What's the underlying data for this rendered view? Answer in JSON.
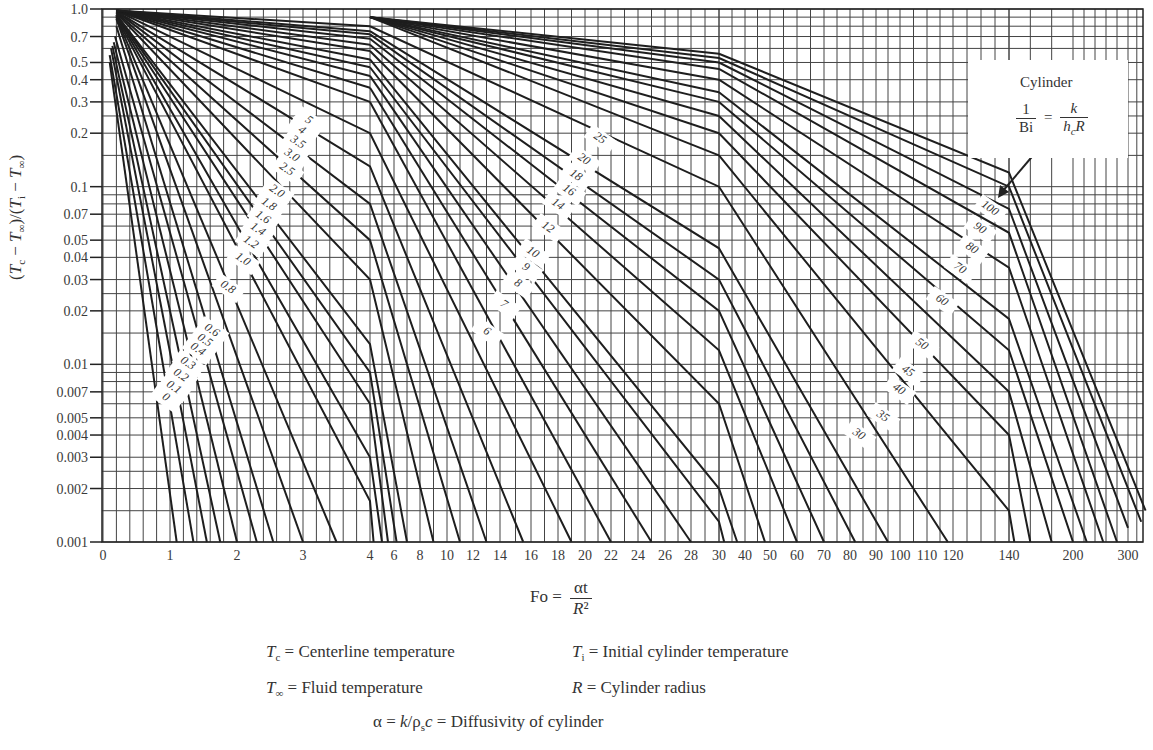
{
  "chart_data": {
    "type": "line",
    "xlabel": "Fo = αt / R²",
    "ylabel": "(Tc − T∞)/(Ti − T∞)",
    "yscale": "log",
    "ylim": [
      0.001,
      1.0
    ],
    "xscale": "piecewise-linear (breaks at 4, 30, 140)",
    "xlim": [
      0,
      350
    ],
    "grid": true,
    "y_ticks": [
      "1.0",
      "0.7",
      "0.5",
      "0.4",
      "0.3",
      "0.2",
      "0.1",
      "0.07",
      "0.05",
      "0.04",
      "0.03",
      "0.02",
      "0.01",
      "0.007",
      "0.005",
      "0.004",
      "0.003",
      "0.002",
      "0.001"
    ],
    "x_ticks": [
      "0",
      "1",
      "2",
      "3",
      "4",
      "6",
      "8",
      "10",
      "12",
      "14",
      "16",
      "18",
      "20",
      "22",
      "24",
      "26",
      "28",
      "30",
      "40",
      "50",
      "60",
      "70",
      "80",
      "90",
      "100",
      "110",
      "120",
      "140",
      "200",
      "300"
    ],
    "legend": {
      "title": "Cylinder",
      "parameter": "1/Bi = k/(h_c R)"
    },
    "series": [
      {
        "name": "0",
        "points": [
          [
            0.1,
            0.5
          ],
          [
            1.1,
            0.001
          ]
        ]
      },
      {
        "name": "0.1",
        "points": [
          [
            0.1,
            0.55
          ],
          [
            1.35,
            0.001
          ]
        ]
      },
      {
        "name": "0.2",
        "points": [
          [
            0.12,
            0.6
          ],
          [
            1.55,
            0.001
          ]
        ]
      },
      {
        "name": "0.3",
        "points": [
          [
            0.14,
            0.62
          ],
          [
            1.75,
            0.001
          ]
        ]
      },
      {
        "name": "0.4",
        "points": [
          [
            0.16,
            0.65
          ],
          [
            2.0,
            0.001
          ]
        ]
      },
      {
        "name": "0.5",
        "points": [
          [
            0.18,
            0.7
          ],
          [
            2.3,
            0.001
          ]
        ]
      },
      {
        "name": "0.6",
        "points": [
          [
            0.2,
            0.8
          ],
          [
            2.55,
            0.001
          ]
        ]
      },
      {
        "name": "0.8",
        "points": [
          [
            0.2,
            0.88
          ],
          [
            3.0,
            0.001
          ]
        ]
      },
      {
        "name": "1.0",
        "points": [
          [
            0.2,
            0.9
          ],
          [
            3.5,
            0.001
          ]
        ]
      },
      {
        "name": "1.2",
        "points": [
          [
            0.2,
            0.9
          ],
          [
            4,
            0.0017
          ],
          [
            4.3,
            0.001
          ]
        ]
      },
      {
        "name": "1.4",
        "points": [
          [
            0.2,
            0.92
          ],
          [
            4,
            0.003
          ],
          [
            5.0,
            0.001
          ]
        ]
      },
      {
        "name": "1.6",
        "points": [
          [
            0.2,
            0.92
          ],
          [
            4,
            0.006
          ],
          [
            5.5,
            0.001
          ]
        ]
      },
      {
        "name": "1.8",
        "points": [
          [
            0.2,
            0.93
          ],
          [
            4,
            0.009
          ],
          [
            6.2,
            0.001
          ]
        ]
      },
      {
        "name": "2.0",
        "points": [
          [
            0.2,
            0.93
          ],
          [
            4,
            0.013
          ],
          [
            7,
            0.001
          ]
        ]
      },
      {
        "name": "2.5",
        "points": [
          [
            0.2,
            0.95
          ],
          [
            4,
            0.03
          ],
          [
            9,
            0.001
          ]
        ]
      },
      {
        "name": "3.0",
        "points": [
          [
            0.2,
            0.96
          ],
          [
            4,
            0.05
          ],
          [
            11,
            0.001
          ]
        ]
      },
      {
        "name": "3.5",
        "points": [
          [
            0.2,
            0.97
          ],
          [
            4,
            0.08
          ],
          [
            13,
            0.001
          ]
        ]
      },
      {
        "name": "4",
        "points": [
          [
            0.2,
            0.97
          ],
          [
            4,
            0.13
          ],
          [
            15.5,
            0.001
          ]
        ]
      },
      {
        "name": "5",
        "points": [
          [
            0.2,
            0.98
          ],
          [
            4,
            0.2
          ],
          [
            19,
            0.001
          ]
        ]
      },
      {
        "name": "6",
        "points": [
          [
            4,
            0.3
          ],
          [
            22,
            0.001
          ]
        ]
      },
      {
        "name": "7",
        "points": [
          [
            4,
            0.36
          ],
          [
            25,
            0.001
          ]
        ]
      },
      {
        "name": "8",
        "points": [
          [
            4,
            0.42
          ],
          [
            28,
            0.001
          ]
        ]
      },
      {
        "name": "9",
        "points": [
          [
            4,
            0.47
          ],
          [
            30,
            0.0013
          ],
          [
            32,
            0.001
          ]
        ]
      },
      {
        "name": "10",
        "points": [
          [
            4,
            0.52
          ],
          [
            30,
            0.002
          ],
          [
            37,
            0.001
          ]
        ]
      },
      {
        "name": "12",
        "points": [
          [
            4,
            0.58
          ],
          [
            30,
            0.006
          ],
          [
            48,
            0.001
          ]
        ]
      },
      {
        "name": "14",
        "points": [
          [
            4,
            0.63
          ],
          [
            30,
            0.012
          ],
          [
            60,
            0.001
          ]
        ]
      },
      {
        "name": "16",
        "points": [
          [
            4,
            0.68
          ],
          [
            30,
            0.02
          ],
          [
            70,
            0.001
          ]
        ]
      },
      {
        "name": "18",
        "points": [
          [
            4,
            0.72
          ],
          [
            30,
            0.03
          ],
          [
            82,
            0.001
          ]
        ]
      },
      {
        "name": "20",
        "points": [
          [
            4,
            0.75
          ],
          [
            30,
            0.045
          ],
          [
            95,
            0.001
          ]
        ]
      },
      {
        "name": "25",
        "points": [
          [
            4,
            0.8
          ],
          [
            30,
            0.1
          ],
          [
            118,
            0.001
          ]
        ]
      },
      {
        "name": "30",
        "points": [
          [
            30,
            0.15
          ],
          [
            140,
            0.0015
          ],
          [
            145,
            0.001
          ]
        ]
      },
      {
        "name": "35",
        "points": [
          [
            30,
            0.2
          ],
          [
            140,
            0.004
          ],
          [
            160,
            0.001
          ]
        ]
      },
      {
        "name": "40",
        "points": [
          [
            30,
            0.25
          ],
          [
            140,
            0.007
          ],
          [
            180,
            0.001
          ]
        ]
      },
      {
        "name": "45",
        "points": [
          [
            30,
            0.3
          ],
          [
            140,
            0.012
          ],
          [
            200,
            0.001
          ]
        ]
      },
      {
        "name": "50",
        "points": [
          [
            30,
            0.34
          ],
          [
            140,
            0.018
          ],
          [
            225,
            0.001
          ]
        ]
      },
      {
        "name": "60",
        "points": [
          [
            30,
            0.4
          ],
          [
            140,
            0.035
          ],
          [
            255,
            0.001
          ]
        ]
      },
      {
        "name": "70",
        "points": [
          [
            30,
            0.46
          ],
          [
            140,
            0.055
          ],
          [
            280,
            0.001
          ]
        ]
      },
      {
        "name": "80",
        "points": [
          [
            30,
            0.5
          ],
          [
            140,
            0.075
          ],
          [
            300,
            0.0012
          ]
        ]
      },
      {
        "name": "90",
        "points": [
          [
            30,
            0.53
          ],
          [
            140,
            0.1
          ],
          [
            330,
            0.0013
          ]
        ]
      },
      {
        "name": "100",
        "points": [
          [
            30,
            0.56
          ],
          [
            140,
            0.12
          ],
          [
            340,
            0.0015
          ]
        ]
      }
    ]
  },
  "axis_label": {
    "y": "(Tc − T∞)/(Ti − T∞)"
  },
  "legend": {
    "title": "Cylinder",
    "lhs_num": "1",
    "lhs_den": "Bi",
    "eq": "=",
    "rhs_num": "k",
    "rhs_den": "h_cR"
  },
  "xlabel": {
    "lhs": "Fo",
    "eq": "=",
    "num": "αt",
    "den": "R²"
  },
  "definitions": {
    "tc": "Tc = Centerline temperature",
    "ti": "Ti = Initial cylinder temperature",
    "tinf": "T∞ = Fluid temperature",
    "r": "R = Cylinder radius",
    "alpha": "α = k/ρsc = Diffusivity of cylinder"
  },
  "label_positions": {
    "group1": [
      [
        "0",
        164,
        400
      ],
      [
        "0.1",
        172,
        390
      ],
      [
        "0.2",
        179,
        378
      ],
      [
        "0.3",
        186,
        366
      ],
      [
        "0.4",
        196,
        352
      ],
      [
        "0.5",
        203,
        343
      ],
      [
        "0.6",
        210,
        333
      ],
      [
        "0.8",
        226,
        290
      ],
      [
        "1.0",
        241,
        262
      ],
      [
        "1.2",
        249,
        245
      ],
      [
        "1.4",
        256,
        232
      ],
      [
        "1.6",
        261,
        220
      ],
      [
        "1.8",
        267,
        207
      ],
      [
        "2.0",
        275,
        194
      ],
      [
        "2.5",
        285,
        172
      ],
      [
        "3.0",
        290,
        158
      ],
      [
        "3.5",
        296,
        145
      ],
      [
        "4",
        300,
        133
      ],
      [
        "5",
        307,
        123
      ]
    ],
    "group2": [
      [
        "6",
        485,
        334
      ],
      [
        "7",
        502,
        307
      ],
      [
        "8",
        516,
        286
      ],
      [
        "9",
        524,
        270
      ],
      [
        "10",
        531,
        255
      ],
      [
        "12",
        546,
        230
      ],
      [
        "14",
        556,
        207
      ],
      [
        "16",
        567,
        193
      ],
      [
        "18",
        574,
        178
      ],
      [
        "20",
        582,
        162
      ],
      [
        "25",
        598,
        141
      ]
    ],
    "group3": [
      [
        "30",
        857,
        437
      ],
      [
        "35",
        881,
        419
      ],
      [
        "40",
        897,
        392
      ],
      [
        "45",
        906,
        374
      ],
      [
        "50",
        920,
        347
      ],
      [
        "60",
        940,
        303
      ],
      [
        "70",
        958,
        271
      ],
      [
        "80",
        970,
        251
      ],
      [
        "90",
        978,
        231
      ],
      [
        "100",
        988,
        211
      ]
    ]
  }
}
